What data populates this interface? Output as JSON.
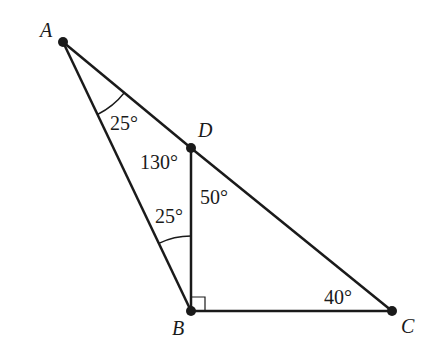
{
  "diagram": {
    "type": "geometry-triangle",
    "colors": {
      "line": "#1a1a1a",
      "background": "#ffffff"
    },
    "points": [
      {
        "id": "A",
        "label": "A",
        "x": 63,
        "y": 42,
        "label_x": 40,
        "label_y": 20
      },
      {
        "id": "D",
        "label": "D",
        "x": 191,
        "y": 148,
        "label_x": 198,
        "label_y": 120
      },
      {
        "id": "B",
        "label": "B",
        "x": 191,
        "y": 311,
        "label_x": 172,
        "label_y": 318
      },
      {
        "id": "C",
        "label": "C",
        "x": 392,
        "y": 311,
        "label_x": 401,
        "label_y": 316
      }
    ],
    "segments": [
      [
        "A",
        "D"
      ],
      [
        "D",
        "C"
      ],
      [
        "A",
        "B"
      ],
      [
        "D",
        "B"
      ],
      [
        "B",
        "C"
      ]
    ],
    "angles": [
      {
        "label": "25°",
        "at": "A",
        "x": 110,
        "y": 113
      },
      {
        "label": "130°",
        "at": "D",
        "x": 142,
        "y": 152
      },
      {
        "label": "50°",
        "at": "D",
        "x": 200,
        "y": 187
      },
      {
        "label": "25°",
        "at": "B",
        "x": 155,
        "y": 206
      },
      {
        "label": "40°",
        "at": "C",
        "x": 324,
        "y": 287
      }
    ],
    "right_angle": {
      "at": "B"
    }
  }
}
